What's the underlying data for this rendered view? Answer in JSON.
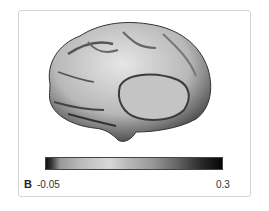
{
  "figure": {
    "panel_label": "B",
    "image_description": "medial-surface-brain-render",
    "colorbar": {
      "min_label": "-0.05",
      "max_label": "0.3",
      "colormap": "grayscale-dark-light-dark"
    }
  }
}
